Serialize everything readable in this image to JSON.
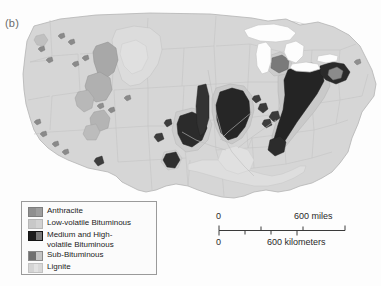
{
  "figure": {
    "panel_label": "(b)",
    "background_color": "#fdfdfd"
  },
  "map": {
    "land_color": "#d6d6d6",
    "land_outline_color": "#b0b0b0",
    "state_border_color": "#c2c2c2",
    "water_color": "#fbfbfb",
    "water_outline_color": "#bdbdbd"
  },
  "legend": {
    "title": "",
    "border_color": "#9a9a9a",
    "background_color": "#fbfbfb",
    "items": [
      {
        "label": "Anthracite",
        "color_left": "#8f8f8f",
        "color_right": "#8f8f8f"
      },
      {
        "label": "Low-volatile Bituminous",
        "color_left": "#c8c8c8",
        "color_right": "#c8c8c8"
      },
      {
        "label": "Medium and High-\nvolatile Bituminous",
        "color_left": "#1c1c1c",
        "color_right": "#787878"
      },
      {
        "label": "Sub-Bituminous",
        "color_left": "#6f6f6f",
        "color_right": "#c4c4c4"
      },
      {
        "label": "Lignite",
        "color_left": "#d4d4d4",
        "color_right": "#e2e2e2"
      }
    ]
  },
  "scalebar": {
    "miles_start": "0",
    "miles_end": "600 miles",
    "km_start": "0",
    "km_end": "600 kilometers",
    "miles_tick_count": 4,
    "km_tick_count": 5
  }
}
